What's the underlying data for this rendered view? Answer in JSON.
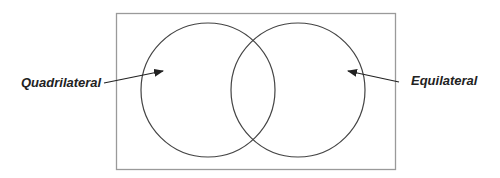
{
  "diagram": {
    "type": "venn",
    "universe": {
      "x": 116,
      "y": 13,
      "width": 279,
      "height": 156,
      "stroke": "#9a9a9a"
    },
    "sets": [
      {
        "name": "Quadrilateral",
        "cx": 208,
        "cy": 90,
        "r": 67
      },
      {
        "name": "Equilateral",
        "cx": 298,
        "cy": 90,
        "r": 67
      }
    ],
    "circle_stroke": "#444444",
    "labels": {
      "left": "Quadrilateral",
      "right": "Equilateral"
    },
    "arrows": [
      {
        "from": "Quadrilateral",
        "x1": 104,
        "y1": 83,
        "x2": 163,
        "y2": 71
      },
      {
        "from": "Equilateral",
        "x1": 399,
        "y1": 82,
        "x2": 348,
        "y2": 71
      }
    ]
  }
}
